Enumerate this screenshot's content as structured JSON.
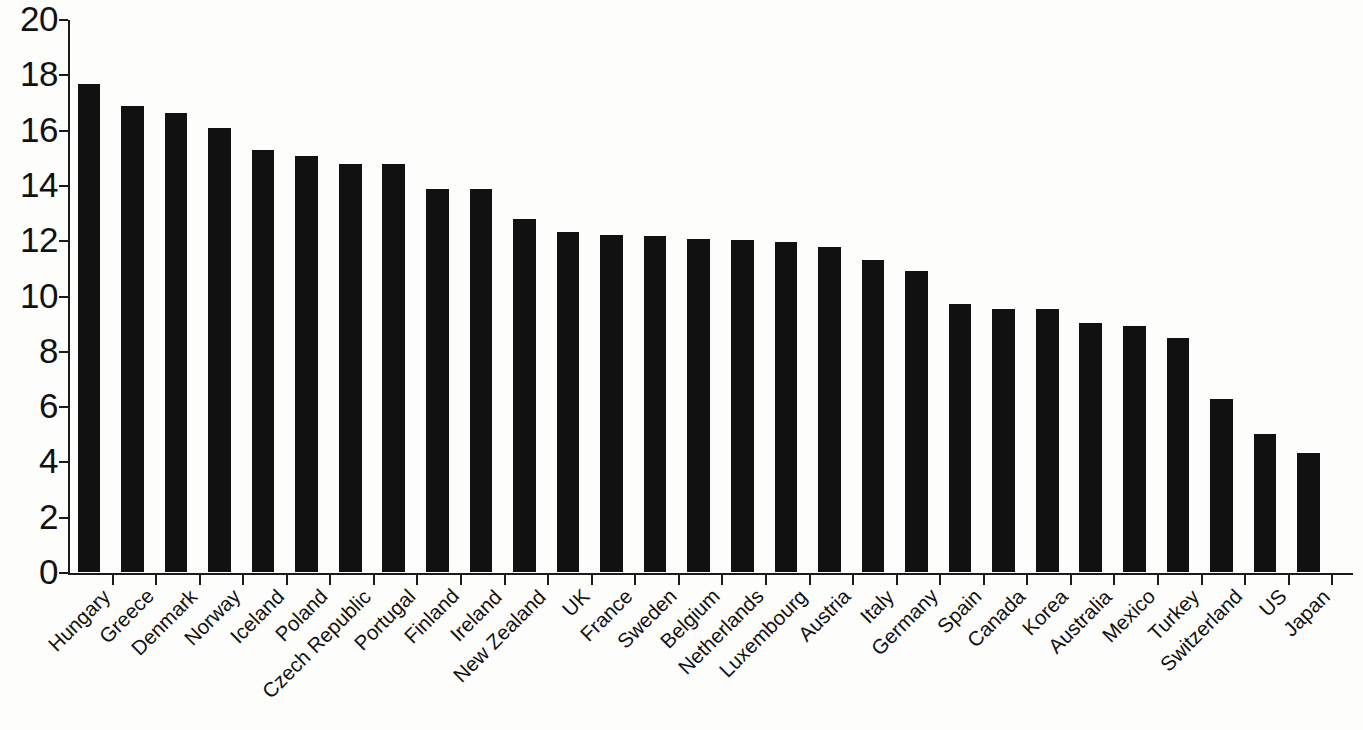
{
  "chart_data": {
    "type": "bar",
    "title": "",
    "subtitle": "",
    "xlabel": "",
    "ylabel": "",
    "ylim": [
      0,
      20
    ],
    "ytick_step": 2,
    "yticks": [
      0,
      2,
      4,
      6,
      8,
      10,
      12,
      14,
      16,
      18,
      20
    ],
    "ytick_labels": [
      "0",
      "2",
      "4",
      "6",
      "8",
      "10",
      "12",
      "14",
      "16",
      "18",
      "20"
    ],
    "grid": false,
    "legend": null,
    "bar_color": "#111111",
    "axis_color": "#1b1b1b",
    "background_color": "#fdfdfc",
    "categories": [
      "Hungary",
      "Greece",
      "Denmark",
      "Norway",
      "Iceland",
      "Poland",
      "Czech Republic",
      "Portugal",
      "Finland",
      "Ireland",
      "New Zealand",
      "UK",
      "France",
      "Sweden",
      "Belgium",
      "Netherlands",
      "Luxembourg",
      "Austria",
      "Italy",
      "Germany",
      "Spain",
      "Canada",
      "Korea",
      "Australia",
      "Mexico",
      "Turkey",
      "Switzerland",
      "US",
      "Japan"
    ],
    "values": [
      17.65,
      16.85,
      16.6,
      16.05,
      15.25,
      15.05,
      14.75,
      14.75,
      13.85,
      13.85,
      12.75,
      12.3,
      12.2,
      12.15,
      12.05,
      12.0,
      11.95,
      11.75,
      11.3,
      10.9,
      9.7,
      9.5,
      9.5,
      9.0,
      8.9,
      8.45,
      6.25,
      5.0,
      4.3
    ]
  }
}
